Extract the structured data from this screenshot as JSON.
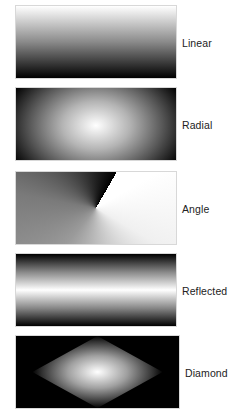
{
  "gradients": [
    {
      "type": "linear",
      "label": "Linear"
    },
    {
      "type": "radial",
      "label": "Radial"
    },
    {
      "type": "angle",
      "label": "Angle"
    },
    {
      "type": "reflected",
      "label": "Reflected"
    },
    {
      "type": "diamond",
      "label": "Diamond"
    }
  ],
  "colors": {
    "start": "#ffffff",
    "end": "#000000",
    "background": "#ffffff"
  }
}
